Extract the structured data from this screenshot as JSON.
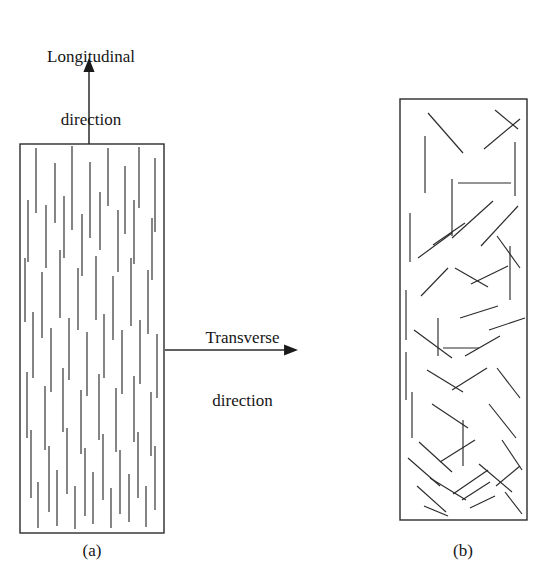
{
  "figure": {
    "title_visible": false,
    "background_color": "#ffffff",
    "stroke_color": "#2b2b2b",
    "width": 552,
    "height": 585
  },
  "annotations": {
    "longitudinal": {
      "line1": "Longitudinal",
      "line2": "direction",
      "arrow": "up-arrow"
    },
    "transverse": {
      "line1": "Transverse",
      "line2": "direction",
      "arrow": "right-arrow"
    }
  },
  "panels": [
    {
      "id": "a",
      "caption": "(a)",
      "description": "aligned fiber orientation",
      "rect": {
        "x": 20,
        "y": 144,
        "width": 144,
        "height": 389
      },
      "fibers": [
        [
          36,
          148,
          36,
          213
        ],
        [
          55,
          163,
          55,
          223
        ],
        [
          72,
          146,
          72,
          230
        ],
        [
          90,
          162,
          90,
          238
        ],
        [
          108,
          148,
          108,
          206
        ],
        [
          125,
          166,
          125,
          234
        ],
        [
          139,
          147,
          139,
          208
        ],
        [
          155,
          158,
          155,
          232
        ],
        [
          28,
          200,
          28,
          262
        ],
        [
          46,
          205,
          46,
          268
        ],
        [
          64,
          196,
          64,
          258
        ],
        [
          82,
          214,
          82,
          276
        ],
        [
          100,
          192,
          100,
          250
        ],
        [
          118,
          210,
          118,
          272
        ],
        [
          134,
          200,
          134,
          264
        ],
        [
          152,
          218,
          152,
          280
        ],
        [
          25,
          258,
          25,
          322
        ],
        [
          42,
          272,
          42,
          338
        ],
        [
          60,
          250,
          60,
          318
        ],
        [
          78,
          268,
          78,
          330
        ],
        [
          96,
          256,
          96,
          320
        ],
        [
          113,
          276,
          113,
          340
        ],
        [
          131,
          258,
          131,
          326
        ],
        [
          148,
          270,
          148,
          334
        ],
        [
          33,
          312,
          33,
          378
        ],
        [
          51,
          328,
          51,
          392
        ],
        [
          69,
          318,
          69,
          380
        ],
        [
          87,
          332,
          87,
          396
        ],
        [
          104,
          314,
          104,
          378
        ],
        [
          122,
          330,
          122,
          394
        ],
        [
          140,
          320,
          140,
          384
        ],
        [
          157,
          334,
          157,
          398
        ],
        [
          27,
          372,
          27,
          438
        ],
        [
          45,
          386,
          45,
          450
        ],
        [
          63,
          368,
          63,
          432
        ],
        [
          81,
          390,
          81,
          454
        ],
        [
          99,
          374,
          99,
          440
        ],
        [
          116,
          388,
          116,
          452
        ],
        [
          134,
          376,
          134,
          442
        ],
        [
          151,
          392,
          151,
          456
        ],
        [
          31,
          430,
          31,
          498
        ],
        [
          49,
          446,
          49,
          512
        ],
        [
          67,
          428,
          67,
          494
        ],
        [
          85,
          448,
          85,
          516
        ],
        [
          103,
          434,
          103,
          500
        ],
        [
          120,
          450,
          120,
          514
        ],
        [
          138,
          432,
          138,
          498
        ],
        [
          155,
          446,
          155,
          510
        ],
        [
          38,
          482,
          38,
          528
        ],
        [
          57,
          470,
          57,
          526
        ],
        [
          75,
          486,
          75,
          529
        ],
        [
          93,
          472,
          93,
          524
        ],
        [
          111,
          488,
          111,
          528
        ],
        [
          129,
          474,
          129,
          522
        ],
        [
          146,
          486,
          146,
          527
        ]
      ]
    },
    {
      "id": "b",
      "caption": "(b)",
      "description": "random fiber orientation",
      "rect": {
        "x": 400,
        "y": 99,
        "width": 127,
        "height": 421
      },
      "fibers": [
        [
          428,
          113,
          463,
          153
        ],
        [
          484,
          149,
          520,
          119
        ],
        [
          495,
          110,
          518,
          129
        ],
        [
          425,
          136,
          425,
          193
        ],
        [
          458,
          183,
          511,
          183
        ],
        [
          515,
          142,
          515,
          196
        ],
        [
          452,
          179,
          452,
          236
        ],
        [
          452,
          238,
          493,
          201
        ],
        [
          410,
          213,
          410,
          262
        ],
        [
          433,
          245,
          465,
          223
        ],
        [
          481,
          246,
          518,
          206
        ],
        [
          497,
          236,
          520,
          268
        ],
        [
          418,
          258,
          452,
          233
        ],
        [
          455,
          268,
          488,
          287
        ],
        [
          510,
          246,
          510,
          300
        ],
        [
          421,
          296,
          448,
          268
        ],
        [
          471,
          284,
          508,
          266
        ],
        [
          406,
          290,
          406,
          340
        ],
        [
          438,
          318,
          438,
          356
        ],
        [
          460,
          318,
          498,
          306
        ],
        [
          489,
          330,
          525,
          318
        ],
        [
          414,
          330,
          452,
          358
        ],
        [
          443,
          348,
          479,
          348
        ],
        [
          465,
          356,
          500,
          336
        ],
        [
          406,
          352,
          406,
          400
        ],
        [
          427,
          370,
          463,
          392
        ],
        [
          452,
          390,
          487,
          368
        ],
        [
          497,
          368,
          520,
          398
        ],
        [
          412,
          392,
          412,
          438
        ],
        [
          432,
          404,
          468,
          428
        ],
        [
          463,
          420,
          463,
          466
        ],
        [
          489,
          404,
          516,
          438
        ],
        [
          419,
          442,
          452,
          472
        ],
        [
          440,
          462,
          475,
          440
        ],
        [
          502,
          440,
          522,
          470
        ],
        [
          408,
          458,
          440,
          486
        ],
        [
          430,
          478,
          466,
          500
        ],
        [
          453,
          494,
          488,
          470
        ],
        [
          479,
          464,
          512,
          492
        ],
        [
          496,
          486,
          520,
          466
        ],
        [
          417,
          486,
          446,
          512
        ],
        [
          462,
          500,
          490,
          482
        ],
        [
          505,
          492,
          522,
          514
        ],
        [
          424,
          506,
          448,
          516
        ],
        [
          470,
          508,
          495,
          496
        ]
      ]
    }
  ],
  "axes": {
    "longitudinal_arrow": {
      "x": 89,
      "y_start": 144,
      "y_end": 58,
      "head_size": 9
    },
    "transverse_arrow": {
      "y": 350,
      "x_start": 165,
      "x_end": 298,
      "head_size": 9
    }
  }
}
